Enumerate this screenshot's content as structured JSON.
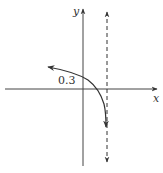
{
  "diagram": {
    "type": "function-graph",
    "axes": {
      "x_label": "x",
      "y_label": "y"
    },
    "curve_label": "0.3",
    "asymptote": "dashed vertical line right of y-axis",
    "colors": {
      "axis": "#444444",
      "curve": "#333333",
      "asymptote": "#333333",
      "background": "#ffffff"
    }
  }
}
